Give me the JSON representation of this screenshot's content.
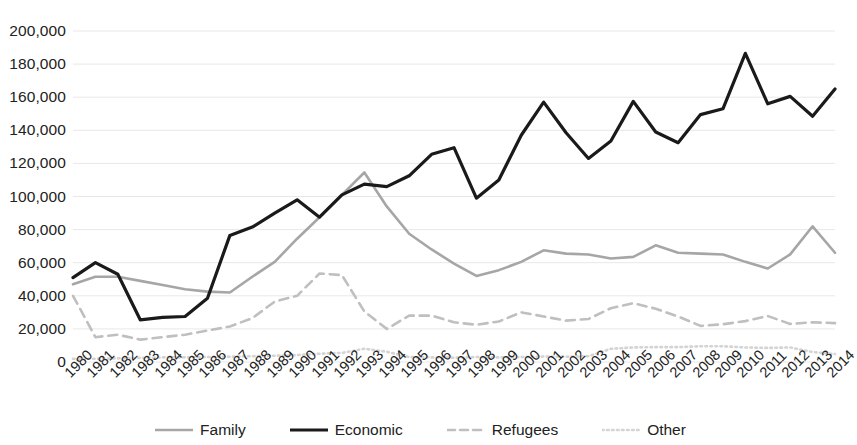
{
  "chart_data": {
    "type": "line",
    "title": "",
    "subtitle": "",
    "xlabel": "",
    "ylabel": "",
    "ylim": [
      0,
      200000
    ],
    "ytick_step": 20000,
    "ytick_labels": [
      "200,000",
      "180,000",
      "160,000",
      "140,000",
      "120,000",
      "100,000",
      "80,000",
      "60,000",
      "40,000",
      "20,000",
      "0"
    ],
    "ytick_values": [
      200000,
      180000,
      160000,
      140000,
      120000,
      100000,
      80000,
      60000,
      40000,
      20000,
      0
    ],
    "grid": true,
    "legend_position": "bottom",
    "categories": [
      "1980",
      "1981",
      "1982",
      "1983",
      "1984",
      "1985",
      "1986",
      "1987",
      "1988",
      "1989",
      "1990",
      "1991",
      "1992",
      "1993",
      "1994",
      "1995",
      "1996",
      "1997",
      "1998",
      "1999",
      "2000",
      "2001",
      "2002",
      "2003",
      "2004",
      "2005",
      "2006",
      "2007",
      "2008",
      "2009",
      "2010",
      "2011",
      "2012",
      "2013",
      "2014"
    ],
    "series": [
      {
        "name": "Family",
        "color": "#a6a6a6",
        "style": "solid",
        "width": 2.6,
        "values": [
          47000,
          51500,
          51500,
          49000,
          46500,
          44000,
          42500,
          42000,
          51500,
          60500,
          74500,
          87500,
          101000,
          114500,
          94000,
          77500,
          68000,
          59500,
          52000,
          55500,
          60500,
          67500,
          65500,
          65000,
          62500,
          63500,
          70500,
          66000,
          65500,
          65000,
          60500,
          56500,
          65000,
          82000,
          66000
        ]
      },
      {
        "name": "Economic",
        "color": "#1a1a1a",
        "style": "solid",
        "width": 3.2,
        "values": [
          51000,
          60000,
          53000,
          25500,
          27000,
          27500,
          38500,
          76500,
          81500,
          90000,
          98000,
          87500,
          101000,
          107500,
          106000,
          112500,
          125500,
          129500,
          99000,
          110000,
          137000,
          157000,
          138500,
          123000,
          133500,
          157500,
          139000,
          132500,
          149500,
          153000,
          186500,
          156000,
          160500,
          148500,
          165000
        ]
      },
      {
        "name": "Refugees",
        "color": "#bfbfbf",
        "style": "dashed",
        "width": 2.6,
        "values": [
          40000,
          15000,
          16500,
          13500,
          15000,
          16500,
          19000,
          21500,
          26500,
          36500,
          40000,
          53500,
          52500,
          30500,
          20000,
          28000,
          28000,
          24000,
          22500,
          24500,
          30000,
          27500,
          25000,
          26000,
          32500,
          35500,
          32200,
          27500,
          21800,
          22800,
          24700,
          27800,
          23000,
          24000,
          23500
        ]
      },
      {
        "name": "Other",
        "color": "#d4d4d4",
        "style": "dotted",
        "width": 2.6,
        "values": [
          2000,
          2000,
          2200,
          2500,
          2800,
          2800,
          3000,
          3200,
          3500,
          3800,
          4200,
          5000,
          5500,
          8000,
          6200,
          3000,
          2800,
          2600,
          3000,
          2800,
          3000,
          3300,
          3200,
          3500,
          8000,
          8800,
          9000,
          9000,
          9500,
          9500,
          8800,
          8500,
          8800,
          6000,
          4800
        ]
      }
    ]
  },
  "legend": {
    "items": [
      {
        "label": "Family",
        "name": "legend-item-family"
      },
      {
        "label": "Economic",
        "name": "legend-item-economic"
      },
      {
        "label": "Refugees",
        "name": "legend-item-refugees"
      },
      {
        "label": "Other",
        "name": "legend-item-other"
      }
    ]
  },
  "colors": {
    "family": "#a6a6a6",
    "economic": "#1a1a1a",
    "refugees": "#bfbfbf",
    "other": "#d4d4d4",
    "grid": "#e8e8e8",
    "text": "#222222",
    "background": "#ffffff"
  }
}
